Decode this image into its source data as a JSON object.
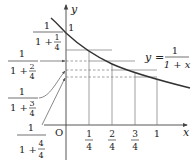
{
  "diagram": {
    "function_label": {
      "lhs": "y",
      "eq": "=",
      "num": "1",
      "den": "1 + x"
    },
    "axes": {
      "x_label": "x",
      "y_label": "y",
      "origin_label": "O"
    },
    "x_ticks": [
      {
        "num": "1",
        "den": "4"
      },
      {
        "num": "2",
        "den": "4"
      },
      {
        "num": "3",
        "den": "4"
      },
      {
        "value": "1"
      }
    ],
    "y_intercept_label": "1",
    "left_labels": [
      {
        "num": "1",
        "den_a": "1 + ",
        "den_num": "1",
        "den_den": "4"
      },
      {
        "num": "1",
        "den_a": "1 + ",
        "den_num": "2",
        "den_den": "4"
      },
      {
        "num": "1",
        "den_a": "1 + ",
        "den_num": "3",
        "den_den": "4"
      },
      {
        "num": "1",
        "den_a": "1 + ",
        "den_num": "4",
        "den_den": "4"
      }
    ]
  }
}
